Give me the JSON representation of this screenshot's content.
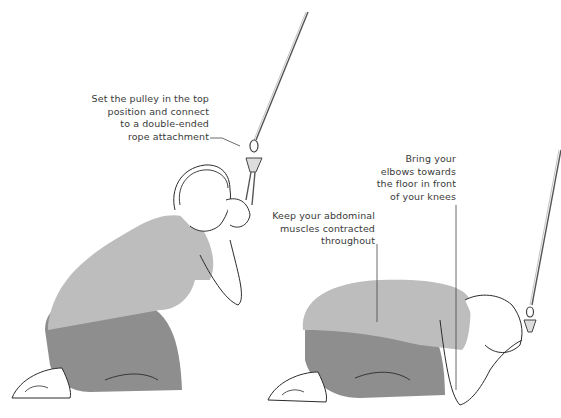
{
  "figures": [
    {
      "name": "start-position",
      "annotation": {
        "lines": [
          "Set the pulley in the top",
          "position and connect",
          "to a double-ended",
          "rope attachment"
        ]
      }
    },
    {
      "name": "end-position",
      "annotations": [
        {
          "lines": [
            "Keep your abdominal",
            "muscles contracted",
            "throughout"
          ]
        },
        {
          "lines": [
            "Bring your",
            "elbows towards",
            "the floor in front",
            "of your knees"
          ]
        }
      ]
    }
  ],
  "colors": {
    "shirt": "#bdbdbd",
    "pants": "#8e8e8e",
    "outline": "#2b2b2b",
    "text": "#3a3a3a",
    "cable": "#555555"
  }
}
